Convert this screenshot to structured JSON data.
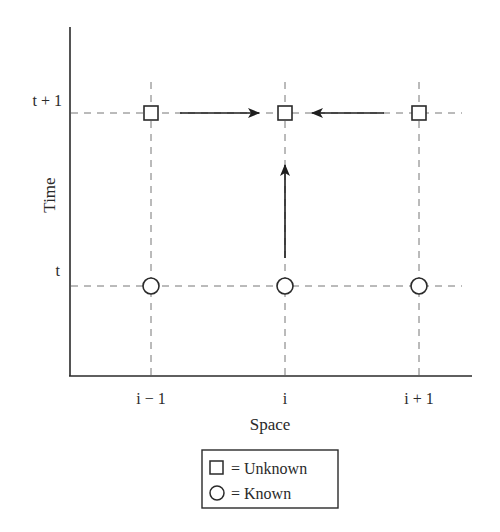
{
  "diagram": {
    "y_axis": {
      "label": "Time",
      "ticks": [
        "t + 1",
        "t"
      ]
    },
    "x_axis": {
      "label": "Space",
      "ticks": [
        "i − 1",
        "i",
        "i + 1"
      ]
    },
    "nodes": [
      {
        "shape": "square",
        "col": "i − 1",
        "row": "t + 1",
        "meaning": "Unknown"
      },
      {
        "shape": "square",
        "col": "i",
        "row": "t + 1",
        "meaning": "Unknown"
      },
      {
        "shape": "square",
        "col": "i + 1",
        "row": "t + 1",
        "meaning": "Unknown"
      },
      {
        "shape": "circle",
        "col": "i − 1",
        "row": "t",
        "meaning": "Known"
      },
      {
        "shape": "circle",
        "col": "i",
        "row": "t",
        "meaning": "Known"
      },
      {
        "shape": "circle",
        "col": "i + 1",
        "row": "t",
        "meaning": "Known"
      }
    ],
    "arrows": [
      {
        "from": "(i − 1, t + 1)",
        "to": "(i, t + 1)"
      },
      {
        "from": "(i + 1, t + 1)",
        "to": "(i, t + 1)"
      },
      {
        "from": "(i, t)",
        "to": "(i, t + 1)"
      }
    ],
    "legend": {
      "items": [
        {
          "symbol": "square-icon",
          "text": "= Unknown"
        },
        {
          "symbol": "circle-icon",
          "text": "= Known"
        }
      ]
    },
    "colors": {
      "line": "#2a2a2a",
      "grid": "#777777",
      "background": "#ffffff"
    }
  }
}
